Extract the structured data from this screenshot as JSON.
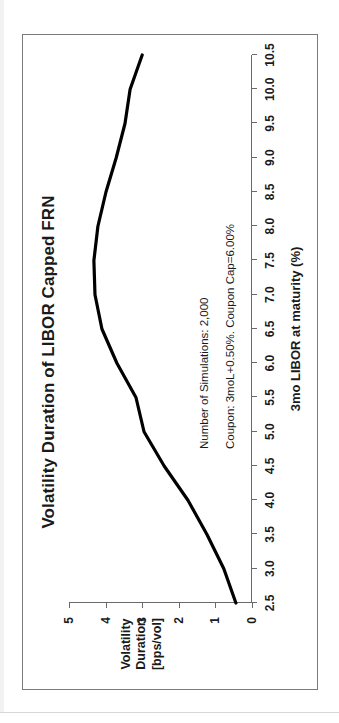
{
  "chart_data": {
    "type": "line",
    "title": "Volatility Duration of LIBOR Capped FRN",
    "xlabel": "3mo LIBOR at maturity (%)",
    "ylabel": "Volatility Duration [bps/vol]",
    "ylabel_lines": [
      "Volatility",
      "Duration",
      "[bps/vol]"
    ],
    "xlim": [
      2.5,
      10.5
    ],
    "ylim": [
      0,
      5
    ],
    "grid": false,
    "legend": "none",
    "line_color": "#000000",
    "xticks": [
      "2.5",
      "3.0",
      "3.5",
      "4.0",
      "4.5",
      "5.0",
      "5.5",
      "6.0",
      "6.5",
      "7.0",
      "7.5",
      "8.0",
      "8.5",
      "9.0",
      "9.5",
      "10.0",
      "10.5"
    ],
    "yticks": [
      "0",
      "1",
      "2",
      "3",
      "4",
      "5"
    ],
    "x": [
      2.5,
      3.0,
      3.5,
      4.0,
      4.5,
      5.0,
      5.5,
      6.0,
      6.5,
      7.0,
      7.5,
      8.0,
      8.5,
      9.0,
      9.5,
      10.0,
      10.5
    ],
    "values": [
      0.44,
      0.77,
      1.23,
      1.75,
      2.4,
      2.95,
      3.17,
      3.69,
      4.1,
      4.29,
      4.32,
      4.21,
      3.99,
      3.71,
      3.47,
      3.33,
      3.0
    ],
    "series": [
      {
        "name": "Volatility Duration",
        "values": [
          0.44,
          0.77,
          1.23,
          1.75,
          2.4,
          2.95,
          3.17,
          3.69,
          4.1,
          4.29,
          4.32,
          4.21,
          3.99,
          3.71,
          3.47,
          3.33,
          3.0
        ]
      }
    ],
    "annotations": [
      "Number of Simulations: 2,000",
      "Coupon: 3moL+0.50%. Coupon Cap=6.00%"
    ]
  }
}
